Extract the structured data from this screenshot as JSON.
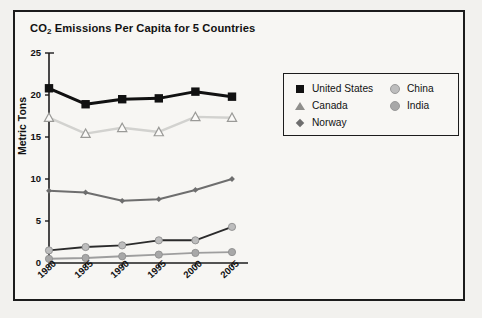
{
  "chart_data": {
    "type": "line",
    "title": "CO2 Emissions Per Capita for 5 Countries",
    "title_main": "CO",
    "title_sub": "2",
    "title_rest": " Emissions Per Capita for 5 Countries",
    "xlabel": "",
    "ylabel": "Metric Tons",
    "categories": [
      "1980",
      "1985",
      "1990",
      "1995",
      "2000",
      "2005"
    ],
    "x": [
      1980,
      1985,
      1990,
      1995,
      2000,
      2005
    ],
    "ylim": [
      0,
      25
    ],
    "yticks": [
      "0",
      "5",
      "10",
      "15",
      "20",
      "25"
    ],
    "ytick_values": [
      0,
      5,
      10,
      15,
      20,
      25
    ],
    "grid": false,
    "legend_position": "upper right",
    "series": [
      {
        "name": "United States",
        "marker": "filled-square",
        "color": "#111111",
        "marker_color": "#111111",
        "values": [
          20.8,
          18.9,
          19.5,
          19.6,
          20.4,
          19.8
        ]
      },
      {
        "name": "Canada",
        "marker": "open-triangle",
        "color": "#d2d2cf",
        "marker_color": "#ffffff",
        "marker_edge": "#9a9a97",
        "values": [
          17.3,
          15.4,
          16.1,
          15.6,
          17.4,
          17.3
        ]
      },
      {
        "name": "Norway",
        "marker": "small-diamond",
        "color": "#6e6e6e",
        "marker_color": "#6e6e6e",
        "values": [
          8.6,
          8.4,
          7.4,
          7.6,
          8.7,
          10.0
        ]
      },
      {
        "name": "China",
        "marker": "filled-circle",
        "color": "#2b2b2b",
        "marker_color": "#bdbdbd",
        "values": [
          1.5,
          1.9,
          2.1,
          2.7,
          2.7,
          4.3
        ]
      },
      {
        "name": "India",
        "marker": "filled-circle",
        "color": "#9e9e9e",
        "marker_color": "#a8a8a8",
        "values": [
          0.5,
          0.6,
          0.8,
          1.0,
          1.2,
          1.3
        ]
      }
    ]
  },
  "legend": {
    "columns": [
      [
        "United States",
        "Canada",
        "Norway"
      ],
      [
        "China",
        "India"
      ]
    ]
  }
}
